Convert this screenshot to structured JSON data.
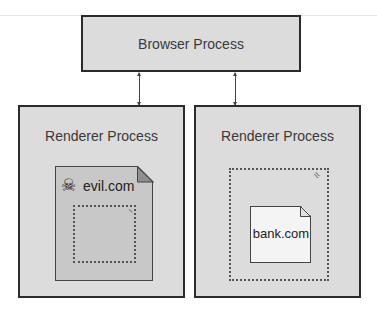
{
  "diagram": {
    "browser": {
      "label": "Browser Process"
    },
    "renderers": [
      {
        "label": "Renderer Process",
        "document": {
          "label": "evil.com",
          "icon": "skull-crossbones-icon",
          "glyph": "☠"
        }
      },
      {
        "label": "Renderer Process",
        "document": {
          "label": "bank.com"
        }
      }
    ],
    "colors": {
      "box_fill": "#dcdcdc",
      "box_border": "#2b2b2b",
      "evil_doc_fill": "#c8c8c8",
      "bank_doc_fill": "#f4f4f4"
    }
  }
}
